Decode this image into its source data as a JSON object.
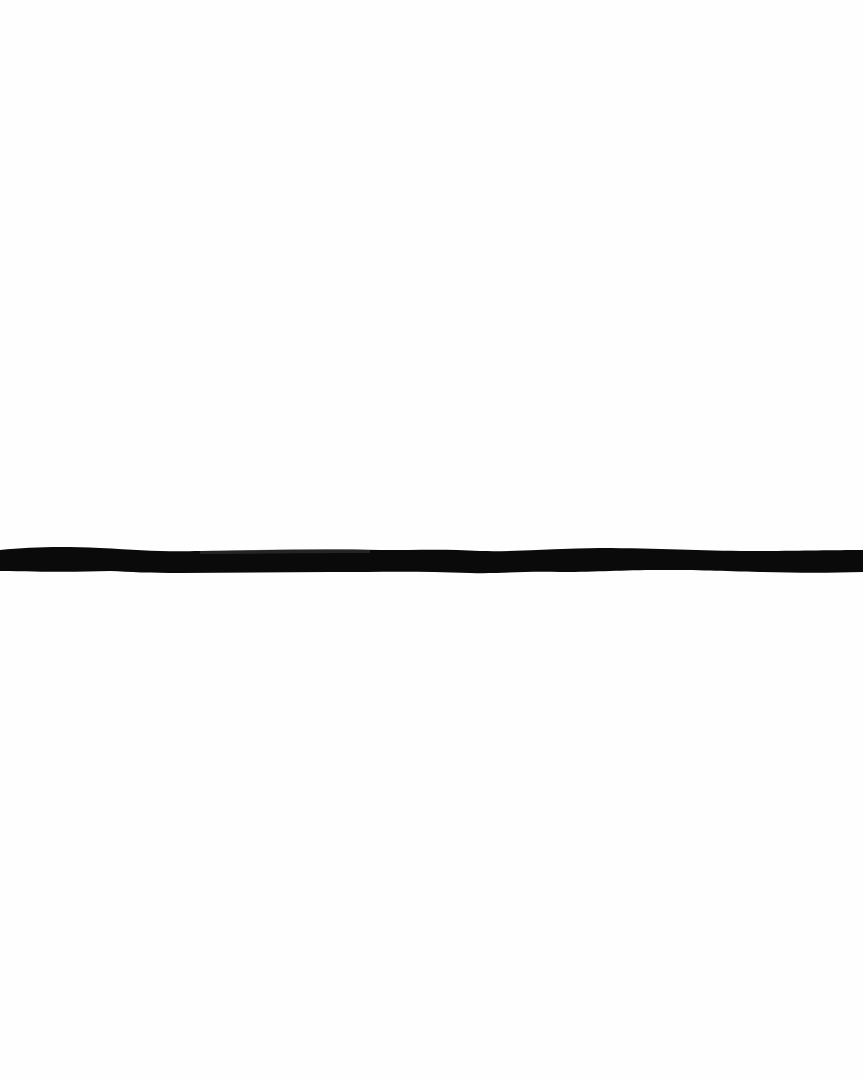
{
  "artwork": {
    "background_color": "#fefefe",
    "stroke_color": "#0a0a0a",
    "stroke_orientation": "horizontal",
    "stroke_count": 1
  }
}
